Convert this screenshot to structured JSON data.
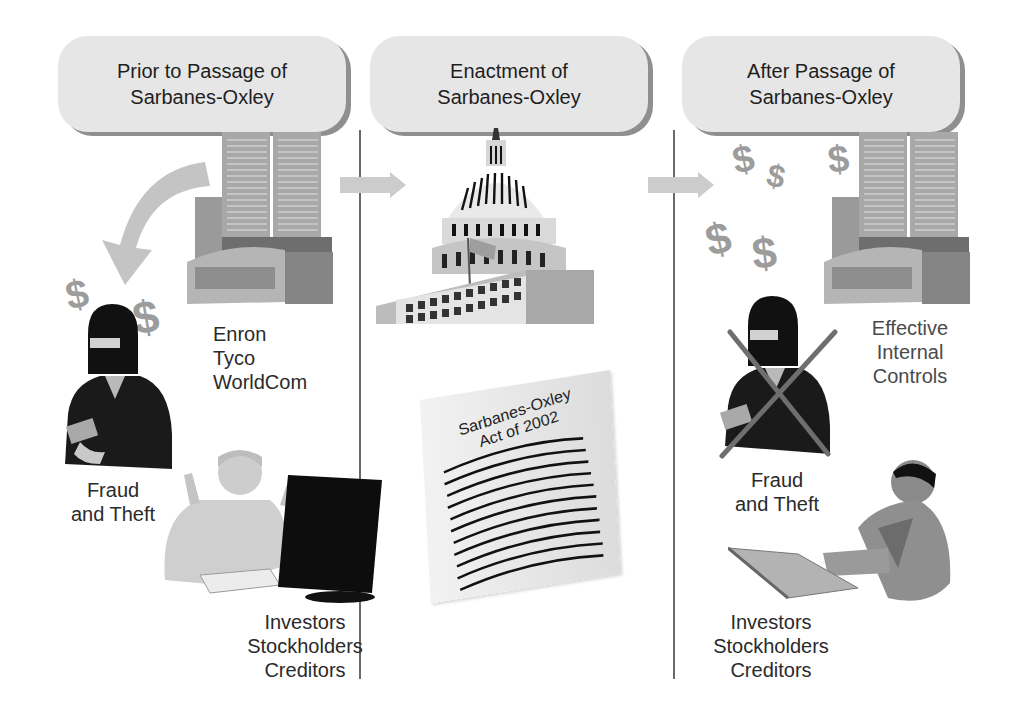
{
  "panels": [
    {
      "header": {
        "line1": "Prior to Passage of",
        "line2": "Sarbanes-Oxley"
      },
      "companies_label": {
        "line1": "Enron",
        "line2": "Tyco",
        "line3": "WorldCom"
      },
      "fraud_label": {
        "line1": "Fraud",
        "line2": "and Theft"
      },
      "stakeholders_label": {
        "line1": "Investors",
        "line2": "Stockholders",
        "line3": "Creditors"
      }
    },
    {
      "header": {
        "line1": "Enactment of",
        "line2": "Sarbanes-Oxley"
      },
      "document_label": {
        "line1": "Sarbanes-Oxley",
        "line2": "Act of 2002"
      }
    },
    {
      "header": {
        "line1": "After Passage of",
        "line2": "Sarbanes-Oxley"
      },
      "controls_label": {
        "line1": "Effective",
        "line2": "Internal",
        "line3": "Controls"
      },
      "fraud_label": {
        "line1": "Fraud",
        "line2": "and Theft"
      },
      "stakeholders_label": {
        "line1": "Investors",
        "line2": "Stockholders",
        "line3": "Creditors"
      }
    }
  ],
  "icons": {
    "dollar_symbol": "$"
  },
  "colors": {
    "header_fill": "#e6e6e6",
    "header_shadow": "#8f8f8f",
    "divider": "#6a6a6a",
    "arrow": "#c8c8c8",
    "cross_mark": "#6e6e6e"
  }
}
